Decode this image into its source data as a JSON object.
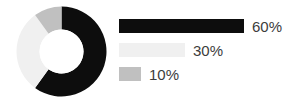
{
  "chart_data": {
    "type": "pie",
    "variant": "donut",
    "title": "",
    "subtitle": "",
    "xlabel": "",
    "ylabel": "",
    "grid": false,
    "legend_position": "right",
    "units": "percent",
    "total": 100,
    "start_angle_deg": 0,
    "direction": "clockwise",
    "inner_radius_ratio": 0.49,
    "categories": [
      "60%",
      "30%",
      "10%"
    ],
    "values": [
      60,
      30,
      10
    ],
    "slices": [
      {
        "label": "60%",
        "value": 60,
        "color": "#0d0d0d",
        "start_angle_deg": 0,
        "end_angle_deg": 216,
        "legend_bar_width_px": 125
      },
      {
        "label": "30%",
        "value": 30,
        "color": "#f0f0f0",
        "start_angle_deg": 216,
        "end_angle_deg": 324,
        "legend_bar_width_px": 66
      },
      {
        "label": "10%",
        "value": 10,
        "color": "#c0c0c0",
        "start_angle_deg": 324,
        "end_angle_deg": 360,
        "legend_bar_width_px": 22
      }
    ],
    "colors": {
      "background": "#ffffff",
      "text": "#3c3c3c",
      "slice_1": "#0d0d0d",
      "slice_2": "#f0f0f0",
      "slice_3": "#c0c0c0"
    },
    "geometry": {
      "center_x": 47.5,
      "center_y": 47.5,
      "outer_radius": 45,
      "inner_radius": 22
    }
  },
  "legend": {
    "items": [
      {
        "label": "60%"
      },
      {
        "label": "30%"
      },
      {
        "label": "10%"
      }
    ]
  }
}
